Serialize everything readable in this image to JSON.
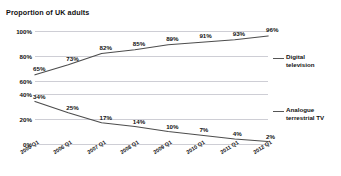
{
  "chart_data": {
    "type": "line",
    "title": "Proportion of UK adults",
    "xlabel": "",
    "ylabel": "",
    "grid": true,
    "legend_position": "right",
    "categories": [
      "2005 Q1",
      "2006 Q1",
      "2007 Q1",
      "2008 Q1",
      "2009 Q1",
      "2010 Q1",
      "2011 Q1",
      "2012 Q1"
    ],
    "panels": [
      {
        "name": "digital-television-panel",
        "series_name": "Digital television",
        "values": [
          65,
          73,
          82,
          85,
          89,
          91,
          93,
          96
        ],
        "value_labels": [
          "65%",
          "73%",
          "82%",
          "85%",
          "89%",
          "91%",
          "93%",
          "96%"
        ],
        "ylim": [
          60,
          100
        ],
        "yticks": [
          60,
          80,
          100
        ],
        "ytick_labels": [
          "60%",
          "80%",
          "100%"
        ]
      },
      {
        "name": "analogue-terrestrial-tv-panel",
        "series_name": "Analogue terrestrial TV",
        "values": [
          34,
          25,
          17,
          14,
          10,
          7,
          4,
          2
        ],
        "value_labels": [
          "34%",
          "25%",
          "17%",
          "14%",
          "10%",
          "7%",
          "4%",
          "2%"
        ],
        "ylim": [
          0,
          40
        ],
        "yticks": [
          0,
          20,
          40
        ],
        "ytick_labels": [
          "0%",
          "20%",
          "40%"
        ]
      }
    ],
    "colors": {
      "line": "#4d4d4d",
      "grid": "#c8c8d0",
      "text": "#111111",
      "background": "#ffffff"
    }
  }
}
